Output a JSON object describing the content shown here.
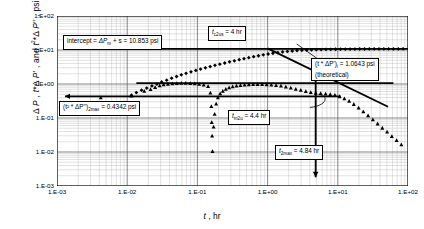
{
  "chart_data": {
    "type": "scatter",
    "title": "",
    "xlabel": "t , hr",
    "ylabel": "Δ P , t*Δ P' , and t²*Δ P'' , psi",
    "xscale": "log",
    "yscale": "log",
    "xlim": [
      0.001,
      100
    ],
    "ylim": [
      0.001,
      100
    ],
    "xticks": [
      "1.E-03",
      "1.E-02",
      "1.E-01",
      "1.E+00",
      "1.E+01",
      "1.E+02"
    ],
    "yticks": [
      "1.E-03",
      "1.E-02",
      "1.E-01",
      "1.E+00",
      "1.E+01",
      "1.E+02"
    ],
    "grid": true,
    "legend": "none",
    "series": [
      {
        "name": "t*ΔP' derivative",
        "marker": "diamond",
        "color": "#000000",
        "points": [
          [
            0.0115,
            0.47
          ],
          [
            0.0135,
            0.56
          ],
          [
            0.016,
            0.66
          ],
          [
            0.019,
            0.76
          ],
          [
            0.0225,
            0.88
          ],
          [
            0.0265,
            1.0
          ],
          [
            0.031,
            1.15
          ],
          [
            0.0365,
            1.3
          ],
          [
            0.043,
            1.48
          ],
          [
            0.0505,
            1.66
          ],
          [
            0.059,
            1.86
          ],
          [
            0.069,
            2.06
          ],
          [
            0.081,
            2.28
          ],
          [
            0.095,
            2.5
          ],
          [
            0.111,
            2.74
          ],
          [
            0.13,
            3.0
          ],
          [
            0.152,
            3.26
          ],
          [
            0.178,
            3.54
          ],
          [
            0.209,
            3.84
          ],
          [
            0.245,
            4.15
          ],
          [
            0.287,
            4.48
          ],
          [
            0.336,
            4.82
          ],
          [
            0.394,
            5.18
          ],
          [
            0.461,
            5.56
          ],
          [
            0.54,
            5.95
          ],
          [
            0.633,
            6.36
          ],
          [
            0.741,
            6.78
          ],
          [
            0.868,
            7.2
          ],
          [
            1.017,
            7.62
          ],
          [
            1.191,
            8.02
          ],
          [
            1.395,
            8.4
          ],
          [
            1.634,
            8.76
          ],
          [
            1.914,
            9.08
          ],
          [
            2.242,
            9.36
          ],
          [
            2.626,
            9.6
          ],
          [
            3.076,
            9.8
          ],
          [
            3.603,
            9.96
          ],
          [
            4.22,
            10.1
          ],
          [
            4.944,
            10.22
          ],
          [
            5.79,
            10.32
          ],
          [
            6.782,
            10.4
          ],
          [
            7.944,
            10.47
          ],
          [
            9.305,
            10.52
          ],
          [
            10.9,
            10.57
          ],
          [
            12.77,
            10.61
          ],
          [
            14.95,
            10.64
          ],
          [
            17.51,
            10.67
          ],
          [
            20.51,
            10.69
          ],
          [
            24.02,
            10.71
          ],
          [
            28.14,
            10.73
          ],
          [
            32.96,
            10.74
          ],
          [
            38.6,
            10.75
          ],
          [
            45.21,
            10.76
          ],
          [
            52.96,
            10.77
          ],
          [
            62.03,
            10.78
          ],
          [
            72.66,
            10.79
          ],
          [
            85.1,
            10.8
          ]
        ]
      },
      {
        "name": "t²*ΔP'' second derivative",
        "marker": "triangle",
        "color": "#000000",
        "points": [
          [
            0.0042,
            0.4
          ],
          [
            0.0115,
            0.45
          ],
          [
            0.0175,
            0.62
          ],
          [
            0.0215,
            0.7
          ],
          [
            0.025,
            0.8
          ],
          [
            0.029,
            0.9
          ],
          [
            0.033,
            0.96
          ],
          [
            0.038,
            1.0
          ],
          [
            0.044,
            1.03
          ],
          [
            0.051,
            1.05
          ],
          [
            0.059,
            1.06
          ],
          [
            0.068,
            1.06
          ],
          [
            0.079,
            1.05
          ],
          [
            0.0915,
            1.03
          ],
          [
            0.106,
            1.0
          ],
          [
            0.123,
            0.95
          ],
          [
            0.142,
            0.86
          ],
          [
            0.153,
            0.55
          ],
          [
            0.158,
            0.22
          ],
          [
            0.16,
            0.075
          ],
          [
            0.162,
            0.03
          ],
          [
            0.164,
            0.0105
          ],
          [
            0.17,
            0.055
          ],
          [
            0.176,
            0.13
          ],
          [
            0.185,
            0.26
          ],
          [
            0.196,
            0.4
          ],
          [
            0.211,
            0.52
          ],
          [
            0.23,
            0.62
          ],
          [
            0.254,
            0.71
          ],
          [
            0.283,
            0.78
          ],
          [
            0.318,
            0.84
          ],
          [
            0.36,
            0.88
          ],
          [
            0.41,
            0.92
          ],
          [
            0.47,
            0.95
          ],
          [
            0.54,
            0.97
          ],
          [
            0.623,
            0.98
          ],
          [
            0.72,
            0.985
          ],
          [
            0.835,
            0.98
          ],
          [
            0.97,
            0.97
          ],
          [
            1.13,
            0.95
          ],
          [
            1.32,
            0.92
          ],
          [
            1.55,
            0.88
          ],
          [
            1.82,
            0.83
          ],
          [
            2.14,
            0.77
          ],
          [
            2.52,
            0.71
          ],
          [
            2.97,
            0.66
          ],
          [
            3.5,
            0.61
          ],
          [
            4.12,
            0.57
          ],
          [
            4.85,
            0.545
          ],
          [
            5.7,
            0.53
          ],
          [
            6.7,
            0.515
          ],
          [
            7.8,
            0.5
          ],
          [
            9.1,
            0.475
          ],
          [
            10.6,
            0.43
          ],
          [
            12.4,
            0.375
          ],
          [
            14.5,
            0.315
          ],
          [
            16.9,
            0.255
          ],
          [
            19.8,
            0.2
          ],
          [
            23.1,
            0.155
          ],
          [
            27.0,
            0.118
          ],
          [
            31.6,
            0.09
          ],
          [
            36.9,
            0.068
          ],
          [
            43.1,
            0.051
          ],
          [
            50.4,
            0.039
          ],
          [
            58.9,
            0.029
          ],
          [
            68.8,
            0.022
          ],
          [
            80.4,
            0.0165
          ]
        ]
      }
    ],
    "reference_lines": [
      {
        "name": "intercept-line",
        "type": "horizontal",
        "y": 10.853,
        "x_from": 0.0013,
        "x_to": 100
      },
      {
        "name": "theoretical-line",
        "type": "horizontal",
        "y": 1.0643,
        "x_from": 0.0135,
        "x_to": 62
      },
      {
        "name": "second-derivative-max-line",
        "type": "horizontal",
        "y": 0.4342,
        "x_from": 0.0013,
        "x_to": 11
      },
      {
        "name": "unit-slope-decline-line",
        "type": "segment",
        "x_from": 1.0,
        "y_from": 11.2,
        "x_to": 52.0,
        "y_to": 0.215
      },
      {
        "name": "tmax-vertical-arrow",
        "type": "vertical",
        "x": 4.84,
        "y_from": 1.45,
        "y_to": 0.0018
      }
    ],
    "annotations": [
      {
        "name": "intercept-note",
        "text": "intercept = ΔP",
        "sub": "m",
        "text2": " + s = 10.853 psi"
      },
      {
        "name": "tc2us-note",
        "text": "t",
        "sub": "c2us",
        "text2": " = 4 hr"
      },
      {
        "name": "theoretical-note",
        "text": "(t * ΔP')",
        "sub": "i",
        "text2": " = 1.0643 psi",
        "line2": "(theoretical)"
      },
      {
        "name": "d2max-note",
        "text": "(t² * ΔP'')",
        "sub": "2max",
        "text2": " = 0.4342 psi"
      },
      {
        "name": "tm2u-note",
        "text": "t",
        "sub": "m2u",
        "text2": " = 4.4 hr"
      },
      {
        "name": "t2max-note",
        "text": "t",
        "sub": "2max",
        "text2": " = 4.84 hr"
      }
    ]
  },
  "axes": {
    "y_label": "Δ P , t*Δ P' , and t²*Δ P'' , psi",
    "x_label": "t , hr",
    "x_ticks": [
      "1.E-03",
      "1.E-02",
      "1.E-01",
      "1.E+00",
      "1.E+01",
      "1.E+02"
    ],
    "y_ticks": [
      "1.E-03",
      "1.E-02",
      "1.E-01",
      "1.E+00",
      "1.E+01",
      "1.E+02"
    ]
  },
  "notes": {
    "intercept": {
      "pre": "intercept = ",
      "sym": "ΔP",
      "sub": "m",
      "post": " + s = 10.853 psi"
    },
    "tc2us": {
      "sym": "t",
      "sub": "c2us",
      "post": " = 4 hr"
    },
    "theoretical": {
      "sym": "(t * ΔP')",
      "sub": "i",
      "post": " = 1.0643 psi",
      "line2": "(theoretical)"
    },
    "d2max": {
      "sym": "(t² * ΔP'')",
      "sub": "2max",
      "post": " = 0.4342 psi"
    },
    "tm2u": {
      "sym": "t",
      "sub": "m2u",
      "post": " = 4.4 hr"
    },
    "t2max": {
      "sym": "t",
      "sub": "2max",
      "post": " = 4.84 hr"
    }
  }
}
